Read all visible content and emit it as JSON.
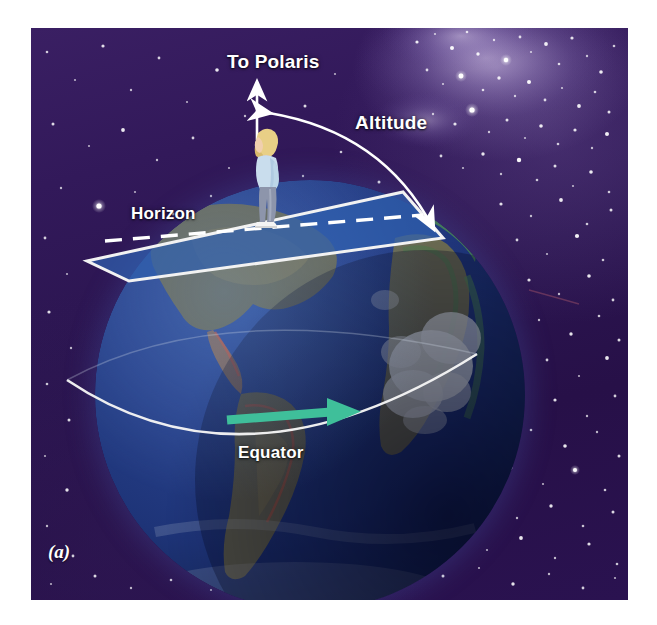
{
  "figure": {
    "panel_label": "(a)",
    "background_color": "#2b1550",
    "canvas": {
      "width": 657,
      "height": 625
    }
  },
  "labels": {
    "to_polaris": "To Polaris",
    "altitude": "Altitude",
    "horizon": "Horizon",
    "equator": "Equator"
  },
  "colors": {
    "sky_deep": "#2b1550",
    "sky_highlight": "#3a1f63",
    "star": "#ffffff",
    "horizon_plane_fill": "#2f5fae",
    "horizon_plane_edge": "#ffffff",
    "equator_line": "#f2f2f2",
    "equator_arrow": "#3fbf9a",
    "ocean": "#27418a",
    "land": "#6b6a4a",
    "cloud": "#dfe6e8",
    "label_text": "#ffffff"
  },
  "elements": {
    "polaris_arrow": {
      "name": "vertical-arrow-to-polaris",
      "direction": "up",
      "color": "#ffffff"
    },
    "altitude_arc": {
      "name": "altitude-angle-arc",
      "double_headed": true,
      "from": "horizon-plane",
      "to": "polaris-direction",
      "color": "#ffffff"
    },
    "horizon_plane": {
      "name": "observer-horizon-plane",
      "shape": "parallelogram",
      "dashed_centerline": true
    },
    "equator_arc": {
      "name": "equator-line",
      "arrow_direction": "east"
    },
    "observer": {
      "name": "observer-figure",
      "pose": "standing, looking up",
      "hair_color": "#e8d08a",
      "top_color": "#c7dcea",
      "pants_color": "#8d95ab",
      "shoe_color": "#f2f2f2"
    },
    "earth": {
      "name": "earth-globe",
      "visible_continents": [
        "North America",
        "South America",
        "Africa",
        "Antarctica-clouds"
      ]
    }
  }
}
